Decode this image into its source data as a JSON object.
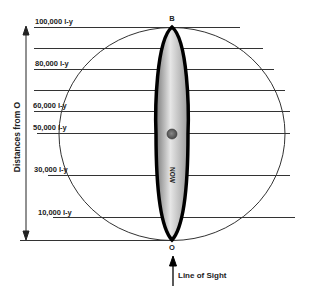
{
  "diagram": {
    "axis_title": "Distances from O",
    "distance_labels": [
      {
        "text": "100,000 l-y",
        "y": 27
      },
      {
        "text": "80,000 l-y",
        "y": 69
      },
      {
        "text": "60,000 l-y",
        "y": 111
      },
      {
        "text": "50,000 l-y",
        "y": 133
      },
      {
        "text": "30,000 l-y",
        "y": 175
      },
      {
        "text": "10,000 l-y",
        "y": 218
      }
    ],
    "point_top": "B",
    "point_bottom": "O",
    "now_label": "NOW",
    "line_of_sight_label": "Line of Sight",
    "colors": {
      "lines": "#333333",
      "outline": "#000000",
      "cigar_fill_light": "#e8e8e8",
      "cigar_fill_dark": "#8a8a8a",
      "dot": "#555555"
    }
  }
}
